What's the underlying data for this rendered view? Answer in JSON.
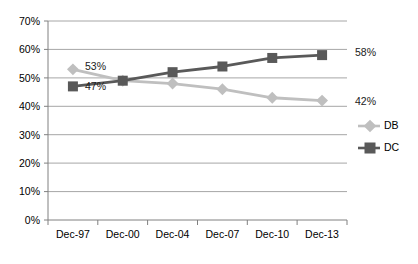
{
  "chart_data": {
    "type": "line",
    "title": "",
    "subtitle": "",
    "xlabel": "",
    "ylabel": "",
    "categories": [
      "Dec-97",
      "Dec-00",
      "Dec-04",
      "Dec-07",
      "Dec-10",
      "Dec-13"
    ],
    "series": [
      {
        "name": "DB",
        "color": "#bfbfbf",
        "marker": "diamond",
        "values": [
          53,
          49,
          48,
          46,
          43,
          42
        ]
      },
      {
        "name": "DC",
        "color": "#595959",
        "marker": "square",
        "values": [
          47,
          49,
          52,
          54,
          57,
          58
        ]
      }
    ],
    "ylim": [
      0,
      70
    ],
    "yticks": [
      0,
      10,
      20,
      30,
      40,
      50,
      60,
      70
    ],
    "ytick_labels": [
      "0%",
      "10%",
      "20%",
      "30%",
      "40%",
      "50%",
      "60%",
      "70%"
    ],
    "grid": true,
    "grid_axis": "y",
    "legend_position": "right",
    "annotations": [
      {
        "text": "53%",
        "series": "DB",
        "point_index": 0,
        "anchor": "right"
      },
      {
        "text": "47%",
        "series": "DC",
        "point_index": 0,
        "anchor": "right"
      },
      {
        "text": "42%",
        "series": "DB",
        "point_index": 5,
        "anchor": "right"
      },
      {
        "text": "58%",
        "series": "DC",
        "point_index": 5,
        "anchor": "right"
      }
    ]
  },
  "axes": {
    "y_labels": [
      "70%",
      "60%",
      "50%",
      "40%",
      "30%",
      "20%",
      "10%",
      "0%"
    ],
    "x_labels": [
      "Dec-97",
      "Dec-00",
      "Dec-04",
      "Dec-07",
      "Dec-10",
      "Dec-13"
    ]
  },
  "legend": {
    "items": [
      {
        "label": "DB",
        "color": "#bfbfbf",
        "marker": "diamond"
      },
      {
        "label": "DC",
        "color": "#595959",
        "marker": "square"
      }
    ]
  },
  "annotations": {
    "db_first": "53%",
    "dc_first": "47%",
    "db_last": "42%",
    "dc_last": "58%"
  }
}
